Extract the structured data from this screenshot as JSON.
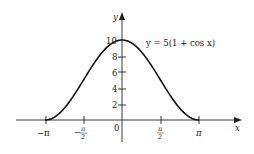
{
  "chart_data": {
    "type": "line",
    "title": "",
    "annotation": "y = 5(1 + cos x)",
    "xlabel": "x",
    "ylabel": "y",
    "x_ticks": [
      "−π",
      "−π/2",
      "0",
      "π/2",
      "π"
    ],
    "x_tick_values": [
      -3.14159,
      -1.5708,
      0,
      1.5708,
      3.14159
    ],
    "y_ticks": [
      "2",
      "4",
      "6",
      "8",
      "10"
    ],
    "y_tick_values": [
      2,
      4,
      6,
      8,
      10
    ],
    "xlim": [
      -4.0,
      3.8
    ],
    "ylim": [
      0,
      10
    ],
    "grid": false,
    "legend": "none",
    "series": [
      {
        "name": "y = 5(1 + cos x)",
        "x": [
          -3.14159,
          -2.35619,
          -1.5708,
          -0.7854,
          0,
          0.7854,
          1.5708,
          2.35619,
          3.14159
        ],
        "values": [
          0,
          1.46,
          5,
          8.54,
          10,
          8.54,
          5,
          1.46,
          0
        ]
      }
    ]
  },
  "labels": {
    "x_axis": "x",
    "y_axis": "y",
    "equation": "y = 5(1 + cos x)",
    "neg_pi": "−π",
    "neg_half_pi_num": "π",
    "neg_half_pi_den": "2",
    "neg_sign": "−",
    "zero": "0",
    "half_pi_num": "π",
    "half_pi_den": "2",
    "pi": "π",
    "y2": "2",
    "y4": "4",
    "y6": "6",
    "y8": "8",
    "y10": "10"
  }
}
